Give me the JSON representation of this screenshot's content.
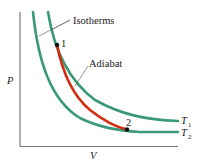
{
  "diagram": {
    "type": "pv-diagram",
    "axes": {
      "y_label": "P",
      "x_label": "V",
      "axis_color": "#777777"
    },
    "labels": {
      "isotherms": "Isotherms",
      "adiabat": "Adiabat",
      "point1": "1",
      "point2": "2",
      "t1": "T",
      "t1_sub": "1",
      "t2": "T",
      "t2_sub": "2"
    },
    "colors": {
      "isotherm": "#3a9a78",
      "adiabat": "#d42a10",
      "point": "#111111",
      "leader": "#555555"
    },
    "curves": [
      {
        "name": "isotherm-T1",
        "kind": "isotherm",
        "temperature": "T1"
      },
      {
        "name": "isotherm-T2",
        "kind": "isotherm",
        "temperature": "T2"
      },
      {
        "name": "adiabat-1-2",
        "kind": "adiabat",
        "from": "1",
        "to": "2"
      }
    ]
  }
}
